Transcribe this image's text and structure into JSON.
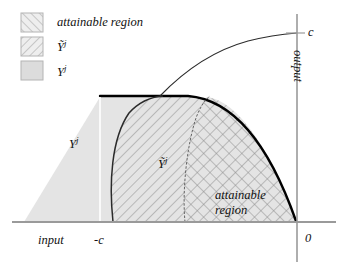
{
  "figure": {
    "legend": {
      "items": [
        {
          "label": "attainable region",
          "pattern": "diagonal-up-hatch",
          "swatch_name": "legend-swatch-attainable-region"
        },
        {
          "label": "Ỹ",
          "superscript": "j",
          "pattern": "diagonal-down-hatch",
          "swatch_name": "legend-swatch-y-tilde"
        },
        {
          "label": "Y",
          "superscript": "j",
          "pattern": "solid-gray",
          "swatch_name": "legend-swatch-y"
        }
      ]
    },
    "axes": {
      "x_label": "input",
      "y_label": "output",
      "origin_label": "0",
      "x_tick_label": "-c",
      "y_tick_label": "c"
    },
    "regions": [
      {
        "name": "Y-j-region",
        "label": "Y",
        "superscript": "j",
        "fill": "solid-gray"
      },
      {
        "name": "Y-tilde-j-region",
        "label": "Ỹ",
        "superscript": "j",
        "fill": "diagonal-down-hatch"
      },
      {
        "name": "attainable-region",
        "label_line1": "attainable",
        "label_line2": "region",
        "fill": "cross-hatch"
      }
    ],
    "colors": {
      "region_fill": "#e2e2e2",
      "hatch_line": "#8a8a8a",
      "axis_line": "#9a9a9a",
      "boundary_curve": "#000000",
      "text": "#111111",
      "swatch_border": "#b4b4b4"
    }
  }
}
